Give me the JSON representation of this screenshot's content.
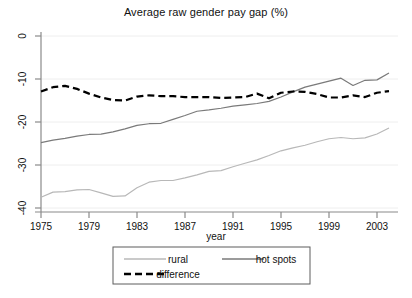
{
  "figure": {
    "title": "Average raw gender pay gap (%)",
    "xlabel": "year",
    "background": "#ffffff"
  },
  "legend": {
    "items": [
      {
        "label": "rural",
        "color": "#b8b8b8",
        "style": "solid"
      },
      {
        "label": "hot spots",
        "color": "#7a7a7a",
        "style": "solid"
      },
      {
        "label": "difference",
        "color": "#000000",
        "style": "dashed"
      }
    ]
  },
  "axes": {
    "y_ticks": [
      "0",
      "-10",
      "-20",
      "-30",
      "-40"
    ],
    "x_ticks": [
      "1975",
      "1979",
      "1983",
      "1987",
      "1991",
      "1995",
      "1999",
      "2003"
    ]
  },
  "chart_data": {
    "type": "line",
    "title": "Average raw gender pay gap (%)",
    "xlabel": "year",
    "ylabel": "",
    "xlim": [
      1975,
      2004
    ],
    "ylim": [
      -40,
      0
    ],
    "grid": true,
    "grid_axis": "y",
    "legend_position": "bottom",
    "x": [
      1975,
      1976,
      1977,
      1978,
      1979,
      1980,
      1981,
      1982,
      1983,
      1984,
      1985,
      1986,
      1987,
      1988,
      1989,
      1990,
      1991,
      1992,
      1993,
      1994,
      1995,
      1996,
      1997,
      1998,
      1999,
      2000,
      2001,
      2002,
      2003,
      2004
    ],
    "series": [
      {
        "name": "rural",
        "color": "#b8b8b8",
        "style": "solid",
        "values": [
          -37.5,
          -36.3,
          -36.2,
          -35.8,
          -35.7,
          -36.5,
          -37.3,
          -37.2,
          -35.3,
          -34.0,
          -33.6,
          -33.6,
          -33.0,
          -32.3,
          -31.5,
          -31.3,
          -30.4,
          -29.6,
          -28.8,
          -27.8,
          -26.7,
          -26.0,
          -25.4,
          -24.6,
          -23.9,
          -23.6,
          -23.9,
          -23.7,
          -22.8,
          -21.4
        ]
      },
      {
        "name": "hot spots",
        "color": "#7a7a7a",
        "style": "solid",
        "values": [
          -24.8,
          -24.2,
          -23.8,
          -23.3,
          -22.9,
          -22.8,
          -22.3,
          -21.6,
          -20.8,
          -20.4,
          -20.3,
          -19.4,
          -18.5,
          -17.5,
          -17.2,
          -16.8,
          -16.3,
          -16.0,
          -15.7,
          -15.2,
          -14.2,
          -13.0,
          -11.9,
          -11.2,
          -10.5,
          -9.8,
          -11.5,
          -10.3,
          -10.2,
          -8.6
        ]
      },
      {
        "name": "difference",
        "color": "#000000",
        "style": "dashed",
        "values": [
          -12.9,
          -11.9,
          -11.6,
          -12.3,
          -13.4,
          -14.3,
          -14.9,
          -15.0,
          -14.1,
          -13.8,
          -14.0,
          -14.0,
          -14.2,
          -14.2,
          -14.2,
          -14.4,
          -14.3,
          -14.2,
          -13.4,
          -14.5,
          -13.2,
          -12.9,
          -13.0,
          -13.5,
          -14.3,
          -14.3,
          -13.8,
          -14.2,
          -13.2,
          -12.8
        ]
      }
    ]
  }
}
